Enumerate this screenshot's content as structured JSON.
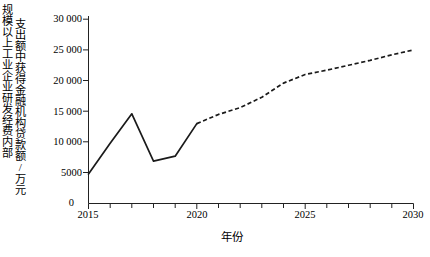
{
  "chart_data": {
    "type": "line",
    "title": "",
    "xlabel": "年份",
    "ylabel_line1": "规模以上工业企业研发经费内部",
    "ylabel_line2": "支出额中获得金融机构贷款额/万元",
    "xlim": [
      2015,
      2030
    ],
    "ylim": [
      0,
      30000
    ],
    "xticks": [
      2015,
      2020,
      2025,
      2030
    ],
    "xticklabels": [
      "2015",
      "2020",
      "2025",
      "2030"
    ],
    "yticks": [
      0,
      5000,
      10000,
      15000,
      20000,
      25000,
      30000
    ],
    "yticklabels": [
      "0",
      "5000",
      "10 000",
      "15 000",
      "20 000",
      "25 000",
      "30 000"
    ],
    "grid": false,
    "legend": "none",
    "minor_xticks_every": 1,
    "series": [
      {
        "name": "实际值",
        "style": "solid",
        "color": "#1a1a1a",
        "x": [
          2015,
          2016,
          2017,
          2018,
          2019,
          2020
        ],
        "values": [
          4800,
          9800,
          14600,
          6900,
          7700,
          13000
        ]
      },
      {
        "name": "预测值",
        "style": "dashed",
        "color": "#1a1a1a",
        "x": [
          2020,
          2021,
          2022,
          2023,
          2024,
          2025,
          2026,
          2027,
          2028,
          2029,
          2030
        ],
        "values": [
          13000,
          14500,
          15600,
          17300,
          19600,
          21000,
          21700,
          22500,
          23300,
          24200,
          25000
        ]
      }
    ]
  }
}
